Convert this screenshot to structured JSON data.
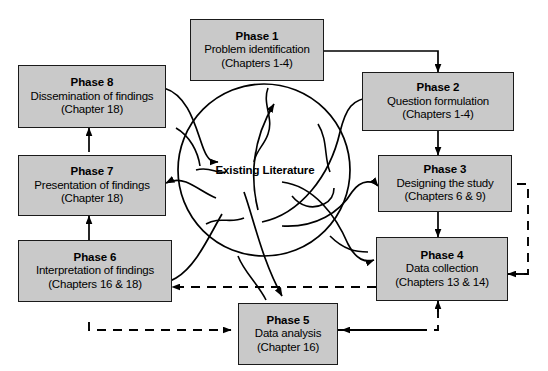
{
  "diagram": {
    "hub": {
      "label": "Existing Literature"
    },
    "colors": {
      "box_fill": "#c9c9c9",
      "box_stroke": "#1a1a1a",
      "arrow": "#000000",
      "background": "#ffffff"
    },
    "phases": [
      {
        "id": "phase-1",
        "title": "Phase 1",
        "desc": "Problem identification",
        "chapters": "(Chapters 1-4)"
      },
      {
        "id": "phase-2",
        "title": "Phase 2",
        "desc": "Question formulation",
        "chapters": "(Chapters 1-4)"
      },
      {
        "id": "phase-3",
        "title": "Phase 3",
        "desc": "Designing the study",
        "chapters": "(Chapters 6 & 9)"
      },
      {
        "id": "phase-4",
        "title": "Phase 4",
        "desc": "Data collection",
        "chapters": "(Chapters 13 & 14)"
      },
      {
        "id": "phase-5",
        "title": "Phase 5",
        "desc": "Data analysis",
        "chapters": "(Chapter 16)"
      },
      {
        "id": "phase-6",
        "title": "Phase 6",
        "desc": "Interpretation of findings",
        "chapters": "(Chapters 16 & 18)"
      },
      {
        "id": "phase-7",
        "title": "Phase 7",
        "desc": "Presentation of findings",
        "chapters": "(Chapter 18)"
      },
      {
        "id": "phase-8",
        "title": "Phase 8",
        "desc": "Dissemination of findings",
        "chapters": "(Chapter 18)"
      }
    ],
    "connections": [
      {
        "from": "phase-1",
        "to": "phase-2",
        "style": "solid"
      },
      {
        "from": "phase-2",
        "to": "phase-3",
        "style": "solid"
      },
      {
        "from": "phase-3",
        "to": "phase-4",
        "style": "solid"
      },
      {
        "from": "phase-6",
        "to": "phase-7",
        "style": "solid"
      },
      {
        "from": "phase-7",
        "to": "phase-8",
        "style": "solid"
      },
      {
        "from": "phase-4",
        "to": "phase-6",
        "style": "dashed"
      },
      {
        "from": "phase-6",
        "to": "phase-5",
        "style": "dashed"
      },
      {
        "from": "phase-5",
        "to": "phase-4",
        "style": "dashed"
      },
      {
        "from": "phase-4",
        "to": "phase-3",
        "style": "dashed"
      },
      {
        "from": "hub",
        "to": "phase-1",
        "style": "curved"
      },
      {
        "from": "hub",
        "to": "phase-2",
        "style": "curved"
      },
      {
        "from": "hub",
        "to": "phase-3",
        "style": "curved"
      },
      {
        "from": "hub",
        "to": "phase-4",
        "style": "curved"
      },
      {
        "from": "hub",
        "to": "phase-5",
        "style": "curved"
      },
      {
        "from": "hub",
        "to": "phase-6",
        "style": "curved"
      },
      {
        "from": "hub",
        "to": "phase-7",
        "style": "curved"
      },
      {
        "from": "phase-8",
        "to": "hub",
        "style": "curved"
      }
    ]
  }
}
